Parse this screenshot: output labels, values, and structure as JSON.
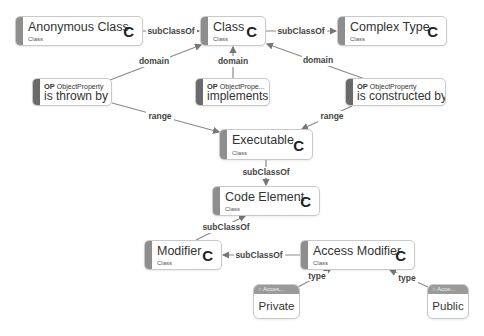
{
  "colors": {
    "background": "#ffffff",
    "node_border": "#c9c9c9",
    "class_bar": "#8e8e8e",
    "property_bar": "#6a6a6a",
    "individual_header": "#9a9a9a",
    "edge": "#777777",
    "text": "#333333"
  },
  "nodes": {
    "anonymous_class": {
      "label": "Anonymous Class",
      "type": "Class",
      "badge": "C"
    },
    "class": {
      "label": "Class",
      "type": "Class",
      "badge": "C"
    },
    "complex_type": {
      "label": "Complex Type",
      "type": "Class",
      "badge": "C"
    },
    "is_thrown_by": {
      "label": "is thrown by",
      "kind_abbr": "OP",
      "kind": "ObjectProperty"
    },
    "implements": {
      "label": "implements",
      "kind_abbr": "OP",
      "kind": "ObjectPrope..."
    },
    "is_constructed_by": {
      "label": "is constructed by",
      "kind_abbr": "OP",
      "kind": "ObjectProperty"
    },
    "executable": {
      "label": "Executable",
      "type": "Class",
      "badge": "C"
    },
    "code_element": {
      "label": "Code Element",
      "type": "Class",
      "badge": "C"
    },
    "modifier": {
      "label": "Modifier",
      "type": "Class",
      "badge": "C"
    },
    "access_modifier": {
      "label": "Access Modifier",
      "type": "Class",
      "badge": "C"
    },
    "private": {
      "label": "Private",
      "header": "Acces..."
    },
    "public": {
      "label": "Public",
      "header": "Acce..."
    }
  },
  "edges": {
    "anon_to_class": "subClassOf",
    "class_to_complex": "subClassOf",
    "thrown_domain": "domain",
    "implements_domain": "domain",
    "constructed_domain": "domain",
    "thrown_range": "range",
    "constructed_range": "range",
    "executable_to_code": "subClassOf",
    "modifier_to_code": "subClassOf",
    "access_to_modifier": "subClassOf",
    "private_type": "type",
    "public_type": "type"
  }
}
